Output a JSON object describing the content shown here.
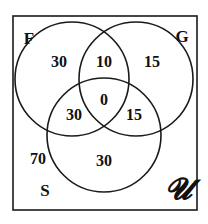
{
  "diagram": {
    "type": "venn-3",
    "universe_label": "𝓤",
    "sets": [
      {
        "name": "F",
        "cx": 72,
        "cy": 79,
        "r": 57,
        "label_x": 29,
        "label_y": 38
      },
      {
        "name": "G",
        "cx": 136,
        "cy": 79,
        "r": 57,
        "label_x": 182,
        "label_y": 36
      },
      {
        "name": "S",
        "cx": 104,
        "cy": 135,
        "r": 57,
        "label_x": 45,
        "label_y": 190
      }
    ],
    "regions": [
      {
        "id": "F-only",
        "value": "30",
        "x": 59,
        "y": 62
      },
      {
        "id": "F-and-G-only",
        "value": "10",
        "x": 104,
        "y": 62
      },
      {
        "id": "G-only",
        "value": "15",
        "x": 152,
        "y": 62
      },
      {
        "id": "F-G-S",
        "value": "0",
        "x": 104,
        "y": 100
      },
      {
        "id": "F-and-S-only",
        "value": "30",
        "x": 74,
        "y": 115
      },
      {
        "id": "G-and-S-only",
        "value": "15",
        "x": 134,
        "y": 115
      },
      {
        "id": "S-only",
        "value": "30",
        "x": 104,
        "y": 161
      },
      {
        "id": "outside",
        "value": "70",
        "x": 38,
        "y": 159
      }
    ],
    "frame": {
      "x": 13,
      "y": 16,
      "width": 184,
      "height": 194
    },
    "universe_pos": {
      "x": 178,
      "y": 189
    },
    "stroke_color": "#1a1a1a"
  }
}
